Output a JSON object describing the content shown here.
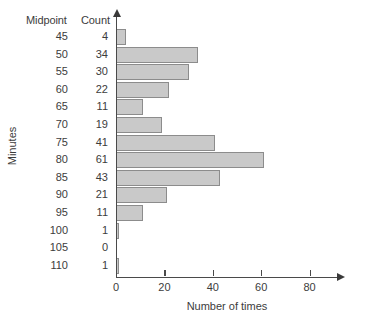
{
  "chart_data": {
    "type": "bar",
    "orientation": "horizontal",
    "title": "",
    "xlabel": "Number of times",
    "ylabel": "Minutes",
    "categories": [
      45,
      50,
      55,
      60,
      65,
      70,
      75,
      80,
      85,
      90,
      95,
      100,
      105,
      110
    ],
    "values": [
      4,
      34,
      30,
      22,
      11,
      19,
      41,
      61,
      43,
      21,
      11,
      1,
      0,
      1
    ],
    "xlim": [
      0,
      92
    ],
    "xticks": [
      0,
      20,
      40,
      60,
      80
    ],
    "xticklabels": [
      "0",
      "20",
      "40",
      "60",
      "80"
    ],
    "grid": false,
    "legend": false,
    "bar_fill": "#c9c9c9",
    "bar_edge": "#8c8c8c",
    "axis_color": "#4a4a4a"
  },
  "table": {
    "header_midpoint": "Midpoint",
    "header_count": "Count",
    "rows": [
      {
        "midpoint": "45",
        "count": "4"
      },
      {
        "midpoint": "50",
        "count": "34"
      },
      {
        "midpoint": "55",
        "count": "30"
      },
      {
        "midpoint": "60",
        "count": "22"
      },
      {
        "midpoint": "65",
        "count": "11"
      },
      {
        "midpoint": "70",
        "count": "19"
      },
      {
        "midpoint": "75",
        "count": "41"
      },
      {
        "midpoint": "80",
        "count": "61"
      },
      {
        "midpoint": "85",
        "count": "43"
      },
      {
        "midpoint": "90",
        "count": "21"
      },
      {
        "midpoint": "95",
        "count": "11"
      },
      {
        "midpoint": "100",
        "count": "1"
      },
      {
        "midpoint": "105",
        "count": "0"
      },
      {
        "midpoint": "110",
        "count": "1"
      }
    ]
  }
}
